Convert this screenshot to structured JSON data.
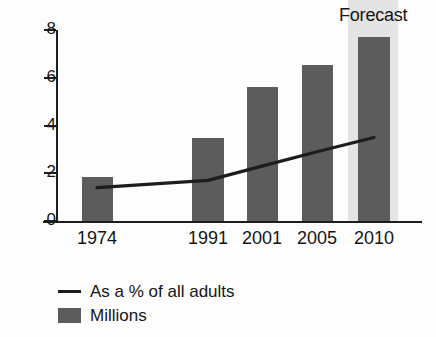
{
  "chart_data": {
    "type": "bar",
    "title": "",
    "subtitle": "",
    "xlabel": "",
    "ylabel": "",
    "categories": [
      "1974",
      "1991",
      "2001",
      "2005",
      "2010"
    ],
    "ylim": [
      0,
      8
    ],
    "yticks": [
      0,
      2,
      4,
      6,
      8
    ],
    "ytick_labels": [
      "0",
      "2",
      "4",
      "6",
      "8"
    ],
    "grid": false,
    "legend_position": "below-left",
    "series": [
      {
        "name": "Millions",
        "type": "bar",
        "color": "#5c5c5c",
        "values": [
          1.85,
          3.48,
          5.62,
          6.55,
          7.7
        ]
      },
      {
        "name": "As a % of all adults",
        "type": "line",
        "color": "#1d1d1d",
        "values": [
          1.4,
          1.7,
          2.3,
          2.9,
          3.5
        ]
      }
    ],
    "annotations": [
      {
        "name": "forecast",
        "label": "Forecast",
        "category": "2010",
        "band_color": "#e4e4e4"
      }
    ]
  },
  "axis": {
    "y_ticks": [
      "8",
      "6",
      "4",
      "2",
      "0"
    ],
    "x_labels": [
      "1974",
      "1991",
      "2001",
      "2005",
      "2010"
    ]
  },
  "annotation": {
    "forecast_label": "Forecast"
  },
  "legend": {
    "items": [
      {
        "label": "As a % of all adults",
        "marker": "line"
      },
      {
        "label": "Millions",
        "marker": "square"
      }
    ]
  },
  "colors": {
    "bar": "#5c5c5c",
    "line": "#1d1d1d",
    "forecast_band": "#e4e4e4",
    "axis": "#1d1d1d",
    "background": "#fdfdfd"
  },
  "geometry": {
    "baseline_y": 221,
    "top_y": 30,
    "px_per_unit": 23.875,
    "bar_centers": [
      97,
      208,
      262,
      317,
      374
    ],
    "bar_widths": [
      31,
      32,
      31,
      31,
      32
    ]
  }
}
